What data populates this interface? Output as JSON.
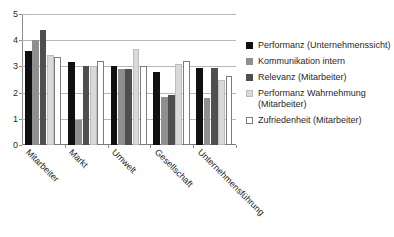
{
  "chart_data": {
    "type": "bar",
    "title": "",
    "xlabel": "",
    "ylabel": "",
    "ylim": [
      0,
      5
    ],
    "yticks": [
      0,
      1,
      2,
      3,
      4,
      5
    ],
    "grid": true,
    "legend_position": "right",
    "categories": [
      "Mitarbeiter",
      "Markt",
      "Umwelt",
      "Gesellschaft",
      "Unternehmensführung"
    ],
    "series": [
      {
        "name": "Performanz (Unternehmenssicht)",
        "color": "#101010",
        "values": [
          3.6,
          3.15,
          3.0,
          2.8,
          2.95
        ]
      },
      {
        "name": "Kommunikation intern",
        "color": "#8f8f8f",
        "values": [
          4.0,
          0.95,
          2.9,
          1.85,
          1.8
        ]
      },
      {
        "name": "Relevanz (Mitarbeiter)",
        "color": "#4f4f4f",
        "values": [
          4.4,
          3.0,
          2.9,
          1.9,
          2.95
        ]
      },
      {
        "name": "Performanz Wahrnehmung (Mitarbeiter)",
        "color": "#d9d9d9",
        "values": [
          3.45,
          3.0,
          3.65,
          3.1,
          2.5
        ]
      },
      {
        "name": "Zufriedenheit (Mitarbeiter)",
        "color": "#ffffff",
        "values": [
          3.35,
          3.2,
          3.0,
          3.2,
          2.65
        ]
      }
    ]
  },
  "legend": {
    "items": [
      {
        "label": "Performanz (Unternehmenssicht)",
        "swatch": "legend-swatch-black"
      },
      {
        "label": "Kommunikation intern",
        "swatch": "legend-swatch-grey"
      },
      {
        "label": "Relevanz (Mitarbeiter)",
        "swatch": "legend-swatch-darkgrey"
      },
      {
        "label": "Performanz Wahrnehmung (Mitarbeiter)",
        "swatch": "legend-swatch-lightgrey"
      },
      {
        "label": "Zufriedenheit (Mitarbeiter)",
        "swatch": "legend-swatch-white"
      }
    ]
  }
}
